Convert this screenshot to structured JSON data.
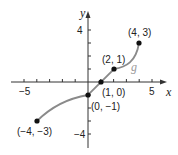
{
  "chart_data": {
    "type": "line",
    "title": "",
    "xlabel": "x",
    "ylabel": "y",
    "xlim": [
      -6,
      6
    ],
    "ylim": [
      -5,
      5
    ],
    "grid": false,
    "x_tick_labels": [
      {
        "value": -5,
        "label": "−5"
      },
      {
        "value": 5,
        "label": "5"
      }
    ],
    "y_tick_labels": [
      {
        "value": 4,
        "label": "4"
      },
      {
        "value": -4,
        "label": "−4"
      }
    ],
    "x_ticks": [
      -5,
      -4,
      -3,
      -2,
      -1,
      1,
      2,
      3,
      4,
      5
    ],
    "y_ticks": [
      -4,
      -3,
      -2,
      -1,
      1,
      2,
      3,
      4
    ],
    "series": [
      {
        "name": "g",
        "color": "#8a8a8a",
        "points": [
          {
            "x": -4,
            "y": -3,
            "label": "(−4, −3)"
          },
          {
            "x": 0,
            "y": -1,
            "label": "(0, −1)"
          },
          {
            "x": 1,
            "y": 0,
            "label": "(1, 0)"
          },
          {
            "x": 2,
            "y": 1,
            "label": "(2, 1)"
          },
          {
            "x": 4,
            "y": 3,
            "label": "(4, 3)"
          }
        ]
      }
    ],
    "annotations": [
      {
        "text": "g",
        "x": 3.5,
        "y": 1.1
      }
    ]
  }
}
